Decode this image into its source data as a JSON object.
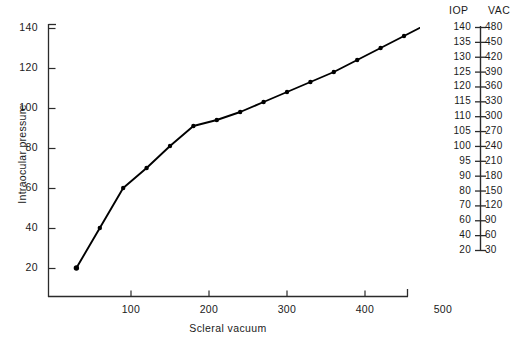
{
  "chart_data": {
    "type": "line",
    "title": "",
    "xlabel": "Scleral vacuum",
    "ylabel": "Intraocular pressure",
    "xlim": [
      0,
      500
    ],
    "ylim": [
      0,
      150
    ],
    "grid": false,
    "legend_position": "none",
    "x_ticks": [
      100,
      200,
      300,
      400,
      500
    ],
    "y_ticks": [
      20,
      40,
      60,
      80,
      100,
      120,
      140
    ],
    "markers": "filled-circle",
    "series": [
      {
        "name": "IOP vs scleral vacuum",
        "x": [
          30,
          60,
          90,
          120,
          150,
          180,
          210,
          240,
          270,
          300,
          330,
          360,
          390,
          420,
          450,
          480
        ],
        "y": [
          20,
          40,
          60,
          70,
          81,
          91,
          94,
          98,
          103,
          108,
          113,
          118,
          124,
          130,
          136,
          142
        ]
      }
    ]
  },
  "axes": {
    "y_tick_labels": [
      "140",
      "120",
      "100",
      "80",
      "60",
      "40",
      "20"
    ],
    "x_tick_labels": [
      "100",
      "200",
      "300",
      "400",
      "500"
    ],
    "y_title": "Intraocular pressure",
    "x_title": "Scleral vacuum"
  },
  "nomogram": {
    "headers": {
      "iop": "IOP",
      "vac": "VAC"
    },
    "rows": [
      {
        "iop": "140",
        "vac": "480"
      },
      {
        "iop": "135",
        "vac": "450"
      },
      {
        "iop": "130",
        "vac": "420"
      },
      {
        "iop": "125",
        "vac": "390"
      },
      {
        "iop": "120",
        "vac": "360"
      },
      {
        "iop": "115",
        "vac": "330"
      },
      {
        "iop": "110",
        "vac": "300"
      },
      {
        "iop": "105",
        "vac": "270"
      },
      {
        "iop": "100",
        "vac": "240"
      },
      {
        "iop": "95",
        "vac": "210"
      },
      {
        "iop": "90",
        "vac": "180"
      },
      {
        "iop": "80",
        "vac": "150"
      },
      {
        "iop": "70",
        "vac": "120"
      },
      {
        "iop": "60",
        "vac": "90"
      },
      {
        "iop": "40",
        "vac": "60"
      },
      {
        "iop": "20",
        "vac": "30"
      }
    ]
  },
  "colors": {
    "ink": "#1a1a1a",
    "line": "#000000",
    "background": "#ffffff"
  }
}
